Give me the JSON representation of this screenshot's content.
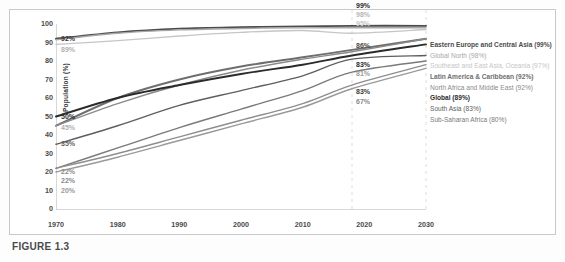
{
  "figure": {
    "caption_label": "FIGURE 1.3",
    "caption_text": ""
  },
  "chart_data": {
    "type": "line",
    "title": "",
    "xlabel": "",
    "ylabel": "Population (%)",
    "xlim": [
      1970,
      2030
    ],
    "ylim": [
      0,
      100
    ],
    "xticks": [
      "1970",
      "1980",
      "1990",
      "2000",
      "2010",
      "2020",
      "2030"
    ],
    "yticks": [
      "0",
      "10",
      "20",
      "30",
      "40",
      "50",
      "60",
      "70",
      "80",
      "90",
      "100"
    ],
    "grid": false,
    "dashed_gridlines": [
      "2018",
      "2030"
    ],
    "legend_position": "right",
    "x": [
      1970,
      1980,
      1990,
      2000,
      2010,
      2018,
      2030
    ],
    "series": [
      {
        "name": "Eastern Europe and Central Asia",
        "legend": "Eastern Europe and Central Asia (99%)",
        "color": "#4c4c4c",
        "bold": true,
        "start_label": "92%",
        "end_label": "99%",
        "values": [
          92,
          95.5,
          97.5,
          98.3,
          98.7,
          99,
          99
        ]
      },
      {
        "name": "Global North",
        "legend": "Global North (98%)",
        "color": "#a8a8a8",
        "bold": false,
        "start_label": "",
        "end_label": "98%",
        "values": [
          91.5,
          95,
          96.8,
          97.6,
          97.9,
          98,
          98
        ]
      },
      {
        "name": "Southeast and East Asia, Oceania",
        "legend": "Southeast and East Asia, Oceania (97%)",
        "color": "#c6c6c6",
        "bold": false,
        "start_label": "89%",
        "end_label": "95%",
        "values": [
          89,
          91,
          93.5,
          95.5,
          96.5,
          95,
          97
        ]
      },
      {
        "name": "Latin America & Caribbean",
        "legend": "Latin America & Caribbean (92%)",
        "color": "#6e6e6e",
        "bold": true,
        "start_label": "",
        "end_label": "86%",
        "values": [
          45,
          60,
          70,
          77,
          82,
          86,
          92
        ]
      },
      {
        "name": "North Africa and Middle East",
        "legend": "North Africa and Middle East (92%)",
        "color": "#8a8a8a",
        "bold": false,
        "start_label": "45%",
        "end_label": "",
        "values": [
          45,
          57,
          67,
          75,
          81,
          85,
          92
        ]
      },
      {
        "name": "Global",
        "legend": "Global (89%)",
        "color": "#2b2b2b",
        "bold": true,
        "start_label": "50%",
        "end_label": "83%",
        "values": [
          50,
          60,
          67,
          73,
          78,
          83,
          89
        ]
      },
      {
        "name": "South Asia",
        "legend": "South Asia (83%)",
        "color": "#5e5e5e",
        "bold": false,
        "start_label": "35%",
        "end_label": "81%",
        "values": [
          35,
          45,
          56,
          64,
          72,
          81,
          83
        ]
      },
      {
        "name": "Sub-Saharan Africa",
        "legend": "Sub-Saharan Africa (80%)",
        "color": "#7a7a7a",
        "bold": false,
        "start_label": "22%",
        "end_label": "83%",
        "values": [
          22,
          33,
          44,
          54,
          64,
          74,
          80
        ]
      },
      {
        "name": "Sub-Saharan Africa low",
        "legend": "",
        "color": "#8e8e8e",
        "bold": false,
        "start_label": "22%",
        "end_label": "67%",
        "values": [
          22,
          30,
          39,
          48,
          57,
          67,
          78
        ]
      },
      {
        "name": "Lowest series",
        "legend": "",
        "color": "#9a9a9a",
        "bold": false,
        "start_label": "20%",
        "end_label": "",
        "values": [
          20,
          28,
          37,
          46,
          55,
          65,
          76
        ]
      }
    ],
    "left_annotations": [
      {
        "text": "92%",
        "value": 92,
        "color": "#3a3a3a"
      },
      {
        "text": "89%",
        "value": 86,
        "color": "#b0b0b0"
      },
      {
        "text": "50%",
        "value": 50,
        "color": "#2b2b2b"
      },
      {
        "text": "45%",
        "value": 44,
        "color": "#b0b0b0"
      },
      {
        "text": "35%",
        "value": 35,
        "color": "#5e5e5e"
      },
      {
        "text": "22%",
        "value": 20,
        "color": "#8a8a8a"
      },
      {
        "text": "22%",
        "value": 15,
        "color": "#8a8a8a"
      },
      {
        "text": "20%",
        "value": 10,
        "color": "#9a9a9a"
      }
    ],
    "right_annotations": [
      {
        "text": "99%",
        "value": 110,
        "color": "#2b2b2b",
        "bold": true
      },
      {
        "text": "98%",
        "value": 105,
        "color": "#b6b6b6",
        "bold": true
      },
      {
        "text": "95%",
        "value": 100,
        "color": "#c8c8c8",
        "bold": true
      },
      {
        "text": "86%",
        "value": 88,
        "color": "#4a4a4a",
        "bold": true
      },
      {
        "text": "83%",
        "value": 78,
        "color": "#2b2b2b",
        "bold": true
      },
      {
        "text": "81%",
        "value": 73,
        "color": "#9a9a9a",
        "bold": true
      },
      {
        "text": "83%",
        "value": 63,
        "color": "#3a3a3a",
        "bold": true
      },
      {
        "text": "67%",
        "value": 58,
        "color": "#8a8a8a",
        "bold": true
      }
    ]
  }
}
